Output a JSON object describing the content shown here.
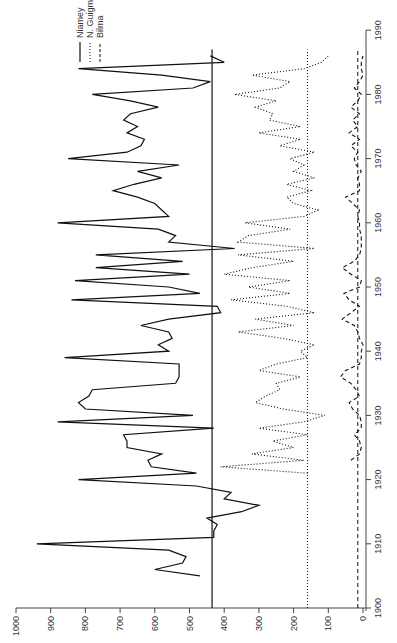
{
  "chart_data": {
    "type": "line",
    "orientation": "rotated-90-clockwise",
    "title": "",
    "xlabel": "",
    "ylabel": "",
    "x_ticks": [
      1900,
      1910,
      1920,
      1930,
      1940,
      1950,
      1960,
      1970,
      1980,
      1990
    ],
    "y_ticks": [
      0,
      100,
      200,
      300,
      400,
      500,
      600,
      700,
      800,
      900,
      1000
    ],
    "xlim": [
      1900,
      1990
    ],
    "ylim": [
      0,
      1000
    ],
    "grid": false,
    "legend": [
      "Niamey",
      "N. Guigmi",
      "Bilma"
    ],
    "legend_position": "upper-left (rotated)",
    "series": [
      {
        "name": "Niamey",
        "style": "solid",
        "mean": 435,
        "x": [
          1905,
          1906,
          1907,
          1908,
          1909,
          1910,
          1911,
          1912,
          1913,
          1914,
          1915,
          1916,
          1917,
          1918,
          1919,
          1920,
          1921,
          1922,
          1923,
          1924,
          1925,
          1926,
          1927,
          1928,
          1929,
          1930,
          1931,
          1932,
          1933,
          1934,
          1935,
          1936,
          1937,
          1938,
          1939,
          1940,
          1941,
          1942,
          1943,
          1944,
          1945,
          1946,
          1947,
          1948,
          1949,
          1950,
          1951,
          1952,
          1953,
          1954,
          1955,
          1956,
          1957,
          1958,
          1959,
          1960,
          1961,
          1962,
          1963,
          1964,
          1965,
          1966,
          1967,
          1968,
          1969,
          1970,
          1971,
          1972,
          1973,
          1974,
          1975,
          1976,
          1977,
          1978,
          1979,
          1980,
          1981,
          1982,
          1983,
          1984,
          1985,
          1986
        ],
        "values": [
          470,
          600,
          520,
          510,
          560,
          940,
          430,
          430,
          420,
          450,
          350,
          300,
          400,
          380,
          480,
          820,
          480,
          610,
          620,
          580,
          680,
          680,
          690,
          430,
          880,
          490,
          800,
          820,
          790,
          780,
          540,
          530,
          530,
          530,
          860,
          560,
          590,
          550,
          560,
          640,
          560,
          410,
          420,
          840,
          470,
          560,
          830,
          500,
          770,
          520,
          770,
          370,
          560,
          540,
          590,
          880,
          560,
          580,
          600,
          650,
          720,
          660,
          580,
          650,
          530,
          850,
          680,
          640,
          630,
          680,
          650,
          690,
          670,
          590,
          670,
          780,
          490,
          440,
          580,
          820,
          400,
          440
        ]
      },
      {
        "name": "N. Guigmi",
        "style": "dotted",
        "mean": 160,
        "x": [
          1921,
          1922,
          1923,
          1924,
          1925,
          1926,
          1927,
          1928,
          1929,
          1930,
          1931,
          1932,
          1933,
          1934,
          1935,
          1936,
          1937,
          1938,
          1939,
          1940,
          1941,
          1942,
          1943,
          1944,
          1945,
          1946,
          1947,
          1948,
          1949,
          1950,
          1951,
          1952,
          1953,
          1954,
          1955,
          1956,
          1957,
          1958,
          1959,
          1960,
          1961,
          1962,
          1963,
          1964,
          1965,
          1966,
          1967,
          1968,
          1969,
          1970,
          1971,
          1972,
          1973,
          1974,
          1975,
          1976,
          1977,
          1978,
          1979,
          1980,
          1981,
          1982,
          1983,
          1984,
          1985,
          1986
        ],
        "values": [
          160,
          410,
          170,
          320,
          200,
          260,
          160,
          300,
          170,
          110,
          230,
          310,
          280,
          240,
          250,
          180,
          300,
          250,
          160,
          180,
          140,
          230,
          360,
          200,
          310,
          140,
          220,
          380,
          210,
          330,
          210,
          400,
          320,
          200,
          360,
          140,
          360,
          330,
          210,
          340,
          170,
          130,
          200,
          220,
          150,
          220,
          140,
          200,
          170,
          210,
          140,
          240,
          180,
          300,
          180,
          270,
          260,
          310,
          250,
          370,
          240,
          210,
          320,
          170,
          120,
          100
        ]
      },
      {
        "name": "Bilma",
        "style": "dashed",
        "mean": 15,
        "x": [
          1923,
          1924,
          1925,
          1926,
          1927,
          1928,
          1929,
          1930,
          1931,
          1932,
          1933,
          1934,
          1935,
          1936,
          1937,
          1938,
          1939,
          1940,
          1941,
          1942,
          1943,
          1944,
          1945,
          1946,
          1947,
          1948,
          1949,
          1950,
          1951,
          1952,
          1953,
          1954,
          1955,
          1956,
          1957,
          1958,
          1959,
          1960,
          1961,
          1962,
          1963,
          1964,
          1965,
          1966,
          1967,
          1968,
          1969,
          1970,
          1971,
          1972,
          1973,
          1974,
          1975,
          1976,
          1977,
          1978,
          1979,
          1980,
          1981,
          1982,
          1983,
          1984,
          1985,
          1986
        ],
        "values": [
          35,
          10,
          5,
          10,
          25,
          5,
          5,
          10,
          30,
          40,
          10,
          20,
          35,
          65,
          50,
          10,
          5,
          5,
          0,
          10,
          15,
          25,
          60,
          35,
          10,
          40,
          55,
          10,
          5,
          35,
          60,
          25,
          10,
          5,
          5,
          5,
          10,
          10,
          15,
          10,
          30,
          50,
          10,
          10,
          15,
          5,
          20,
          25,
          15,
          35,
          10,
          40,
          15,
          30,
          10,
          35,
          15,
          5,
          25,
          10,
          0,
          5,
          5,
          0
        ]
      }
    ],
    "mean_lines": {
      "Niamey": 435,
      "N. Guigmi": 160,
      "Bilma": 15
    }
  },
  "axes": {
    "year_label_1900": "1900",
    "year_label_1910": "1910",
    "year_label_1920": "1920",
    "year_label_1930": "1930",
    "year_label_1940": "1940",
    "year_label_1950": "1950",
    "year_label_1960": "1960",
    "year_label_1970": "1970",
    "year_label_1980": "1980",
    "year_label_1990": "1990"
  },
  "legend": {
    "niamey": "Niamey",
    "nguigmi": "N. Guigmi",
    "bilma": "Bilma"
  }
}
